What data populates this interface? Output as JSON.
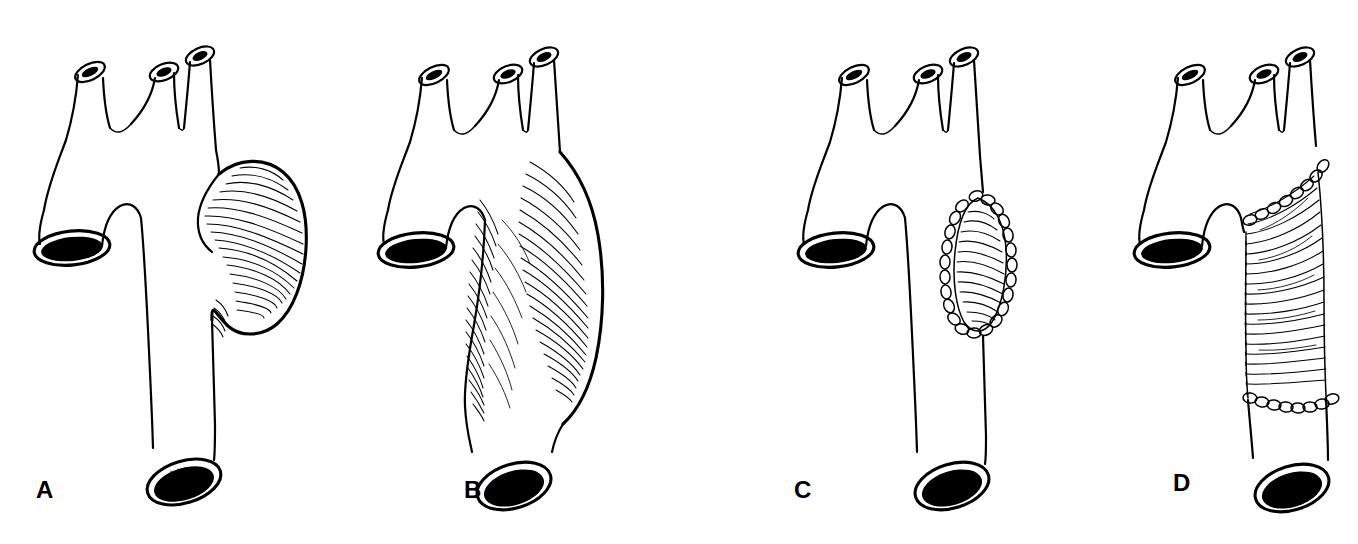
{
  "figure": {
    "background_color": "#ffffff",
    "ink_color": "#000000",
    "style": "pen-and-ink medical line illustration with hatching",
    "width": 1358,
    "height": 544,
    "panel_count": 4
  },
  "panels": [
    {
      "id": "a",
      "label": "A",
      "label_x": 36,
      "label_y": 478,
      "caption": "Saccular aneurysm arising from the descending thoracic aorta",
      "lesion_type": "saccular aneurysm",
      "repaired": false
    },
    {
      "id": "b",
      "label": "B",
      "label_x": 464,
      "label_y": 478,
      "caption": "Fusiform aneurysm involving the descending thoracic aorta",
      "lesion_type": "fusiform aneurysm",
      "repaired": false
    },
    {
      "id": "c",
      "label": "C",
      "label_x": 794,
      "label_y": 478,
      "caption": "Repair of saccular aneurysm by patch aortoplasty with running suture line",
      "lesion_type": "patch repair",
      "repaired": true
    },
    {
      "id": "d",
      "label": "D",
      "label_x": 1173,
      "label_y": 471,
      "caption": "Repair of fusiform aneurysm by interposition tube graft with proximal and distal anastomoses",
      "lesion_type": "tube graft replacement",
      "repaired": true
    }
  ],
  "anatomy": {
    "structures": [
      "ascending aorta",
      "aortic arch",
      "brachiocephalic trunk",
      "left common carotid artery",
      "left subclavian artery",
      "descending thoracic aorta"
    ],
    "branch_vessel_count": 3,
    "cut_ends": [
      "proximal ascending aorta",
      "distal descending aorta"
    ]
  }
}
